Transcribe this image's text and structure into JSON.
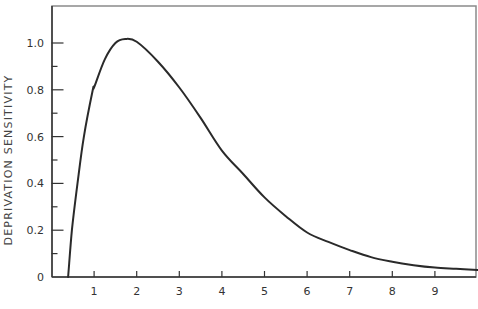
{
  "chart_data": {
    "type": "line",
    "title": "",
    "xlabel": "",
    "ylabel": "DEPRIVATION SENSITIVITY",
    "xlim": [
      0,
      10
    ],
    "ylim": [
      0,
      1.15
    ],
    "x_ticks": [
      1,
      2,
      3,
      4,
      5,
      6,
      7,
      8,
      9
    ],
    "x_tick_labels": [
      "1",
      "2",
      "3",
      "4",
      "5",
      "6",
      "7",
      "8",
      "9"
    ],
    "y_ticks": [
      0,
      0.2,
      0.4,
      0.6,
      0.8,
      1.0
    ],
    "y_tick_labels": [
      "0",
      "0.2",
      "0.4",
      "0.6",
      "0.8",
      "1.0"
    ],
    "y_minor_ticks": [
      0.1,
      0.3,
      0.5,
      0.7,
      0.9
    ],
    "grid": false,
    "legend": null,
    "series": [
      {
        "name": "Deprivation sensitivity",
        "x": [
          0.39,
          0.48,
          0.61,
          0.76,
          0.97,
          1.0,
          1.25,
          1.5,
          1.73,
          2.0,
          2.5,
          3.0,
          3.5,
          4.0,
          4.5,
          5.0,
          5.5,
          6.0,
          6.5,
          7.0,
          7.5,
          8.0,
          8.5,
          9.0,
          9.5,
          10.0
        ],
        "y": [
          0.0,
          0.2,
          0.4,
          0.6,
          0.8,
          0.81,
          0.93,
          1.0,
          1.017,
          1.005,
          0.92,
          0.81,
          0.68,
          0.54,
          0.44,
          0.34,
          0.26,
          0.19,
          0.15,
          0.115,
          0.085,
          0.065,
          0.05,
          0.04,
          0.035,
          0.03
        ]
      }
    ]
  },
  "plot_area": {
    "left": 51.5,
    "right": 476,
    "top": 6,
    "bottom": 277,
    "x_px_per_unit": 42.6,
    "y_px_per_unit": 234
  }
}
